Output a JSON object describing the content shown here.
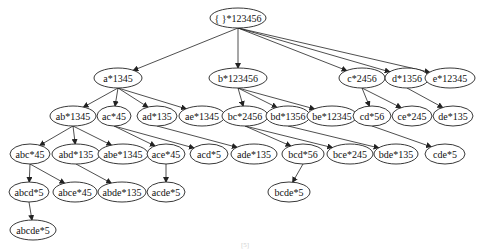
{
  "diagram": {
    "type": "tree",
    "nodes": [
      {
        "id": "root",
        "label": "{ }*123456"
      },
      {
        "id": "a",
        "label": "a*1345"
      },
      {
        "id": "b",
        "label": "b*123456"
      },
      {
        "id": "c",
        "label": "c*2456"
      },
      {
        "id": "d",
        "label": "d*1356"
      },
      {
        "id": "e",
        "label": "e*12345"
      },
      {
        "id": "ab",
        "label": "ab*1345"
      },
      {
        "id": "ac",
        "label": "ac*45"
      },
      {
        "id": "ad",
        "label": "ad*135"
      },
      {
        "id": "ae",
        "label": "ae*1345"
      },
      {
        "id": "bc",
        "label": "bc*2456"
      },
      {
        "id": "bd",
        "label": "bd*1356"
      },
      {
        "id": "be",
        "label": "be*12345"
      },
      {
        "id": "cd",
        "label": "cd*56"
      },
      {
        "id": "ce",
        "label": "ce*245"
      },
      {
        "id": "de",
        "label": "de*135"
      },
      {
        "id": "abc",
        "label": "abc*45"
      },
      {
        "id": "abd",
        "label": "abd*135"
      },
      {
        "id": "abe",
        "label": "abe*1345"
      },
      {
        "id": "ace",
        "label": "ace*45"
      },
      {
        "id": "acd",
        "label": "acd*5"
      },
      {
        "id": "ade",
        "label": "ade*135"
      },
      {
        "id": "bcd",
        "label": "bcd*56"
      },
      {
        "id": "bce",
        "label": "bce*245"
      },
      {
        "id": "bde",
        "label": "bde*135"
      },
      {
        "id": "cde",
        "label": "cde*5"
      },
      {
        "id": "abcd",
        "label": "abcd*5"
      },
      {
        "id": "abce",
        "label": "abce*45"
      },
      {
        "id": "abde",
        "label": "abde*135"
      },
      {
        "id": "acde",
        "label": "acde*5"
      },
      {
        "id": "bcde",
        "label": "bcde*5"
      },
      {
        "id": "abcde",
        "label": "abcde*5"
      }
    ],
    "edges": [
      [
        "root",
        "a"
      ],
      [
        "root",
        "b"
      ],
      [
        "root",
        "c"
      ],
      [
        "root",
        "d"
      ],
      [
        "root",
        "e"
      ],
      [
        "a",
        "ab"
      ],
      [
        "a",
        "ac"
      ],
      [
        "a",
        "ad"
      ],
      [
        "a",
        "ae"
      ],
      [
        "b",
        "bc"
      ],
      [
        "b",
        "bd"
      ],
      [
        "b",
        "be"
      ],
      [
        "c",
        "cd"
      ],
      [
        "c",
        "ce"
      ],
      [
        "d",
        "de"
      ],
      [
        "ab",
        "abc"
      ],
      [
        "ab",
        "abd"
      ],
      [
        "ab",
        "abe"
      ],
      [
        "ac",
        "acd"
      ],
      [
        "ac",
        "ace"
      ],
      [
        "ad",
        "ade"
      ],
      [
        "bc",
        "bcd"
      ],
      [
        "bc",
        "bce"
      ],
      [
        "bd",
        "bde"
      ],
      [
        "cd",
        "cde"
      ],
      [
        "abc",
        "abcd"
      ],
      [
        "abc",
        "abce"
      ],
      [
        "abd",
        "abde"
      ],
      [
        "ace",
        "acde"
      ],
      [
        "bcd",
        "bcde"
      ],
      [
        "abcd",
        "abcde"
      ]
    ],
    "caption": "[5]"
  }
}
